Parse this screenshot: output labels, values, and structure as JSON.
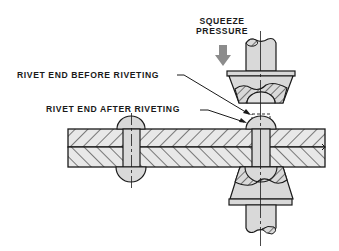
{
  "diagram": {
    "type": "technical illustration",
    "labels": {
      "squeeze_pressure_line1": "SQUEEZE",
      "squeeze_pressure_line2": "PRESSURE",
      "rivet_before": "RIVET END BEFORE RIVETING",
      "rivet_after": "RIVET END AFTER RIVETING"
    },
    "colors": {
      "line": "#1a1a1a",
      "fill": "#d9d9d9",
      "plate_fill": "#e6e6e6",
      "arrow": "#8c8c8c",
      "background": "#ffffff"
    },
    "components": [
      "upper-squeeze-die",
      "lower-squeeze-die",
      "riveted-sheets",
      "driven-rivet",
      "formed-rivet",
      "pressure-arrow"
    ]
  }
}
